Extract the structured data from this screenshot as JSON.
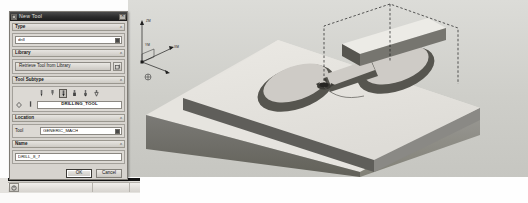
{
  "app": {
    "viewport_name": "cad-3d-viewport",
    "background_color": "#cfcfcb"
  },
  "viewport": {
    "model_description": "Isometric machined rectangular block with stepped ledge and figure-eight shaped pocket",
    "face_top_color": "#e3e1dc",
    "face_left_color": "#6e6d69",
    "face_right_color": "#8d8c88",
    "pocket_floor_color": "#c9c7c2",
    "pocket_wall_color": "#5c5b57",
    "toolpath_color": "#1a1a1a",
    "axis_triad": {
      "name": "work-coordinate-triad",
      "labels": [
        "ZM",
        "YM",
        "XM"
      ]
    }
  },
  "dialog": {
    "title": "New Tool",
    "icon": "dialog-window-icon",
    "close_label": "✕",
    "groups": {
      "type": {
        "header": "Type",
        "collapse_caret": "ʌ",
        "value": "drill",
        "dropdown_icon": "dropdown-button-icon"
      },
      "library": {
        "header": "Library",
        "collapse_caret": "ʌ",
        "retrieve_button": "Retrieve Tool from Library",
        "browse_icon": "library-browse-icon"
      },
      "subtype": {
        "header": "Tool Subtype",
        "collapse_caret": "ʌ",
        "icons": [
          {
            "name": "drill-tool-icon",
            "selected": false
          },
          {
            "name": "center-drill-tool-icon",
            "selected": false
          },
          {
            "name": "spot-drilling-tool-icon",
            "selected": true
          },
          {
            "name": "counterbore-tool-icon",
            "selected": false
          },
          {
            "name": "step-drill-tool-icon",
            "selected": false
          },
          {
            "name": "countersink-tool-icon",
            "selected": false
          },
          {
            "name": "tap-tool-icon",
            "selected": false
          },
          {
            "name": "reamer-tool-icon",
            "selected": false
          }
        ],
        "selected_label": "DRILLING_TOOL"
      },
      "location": {
        "header": "Location",
        "collapse_caret": "ʌ",
        "tool_label": "Tool",
        "tool_value": "GENERIC_MACH",
        "dropdown_icon": "dropdown-button-icon"
      },
      "name": {
        "header": "Name",
        "collapse_caret": "ʌ",
        "value": "DRILL_8_7"
      }
    },
    "footer": {
      "ok_label": "OK",
      "cancel_label": "Cancel"
    }
  },
  "taskbar": {
    "start_icon": "start-button-icon",
    "segments": [
      "",
      "",
      ""
    ]
  }
}
